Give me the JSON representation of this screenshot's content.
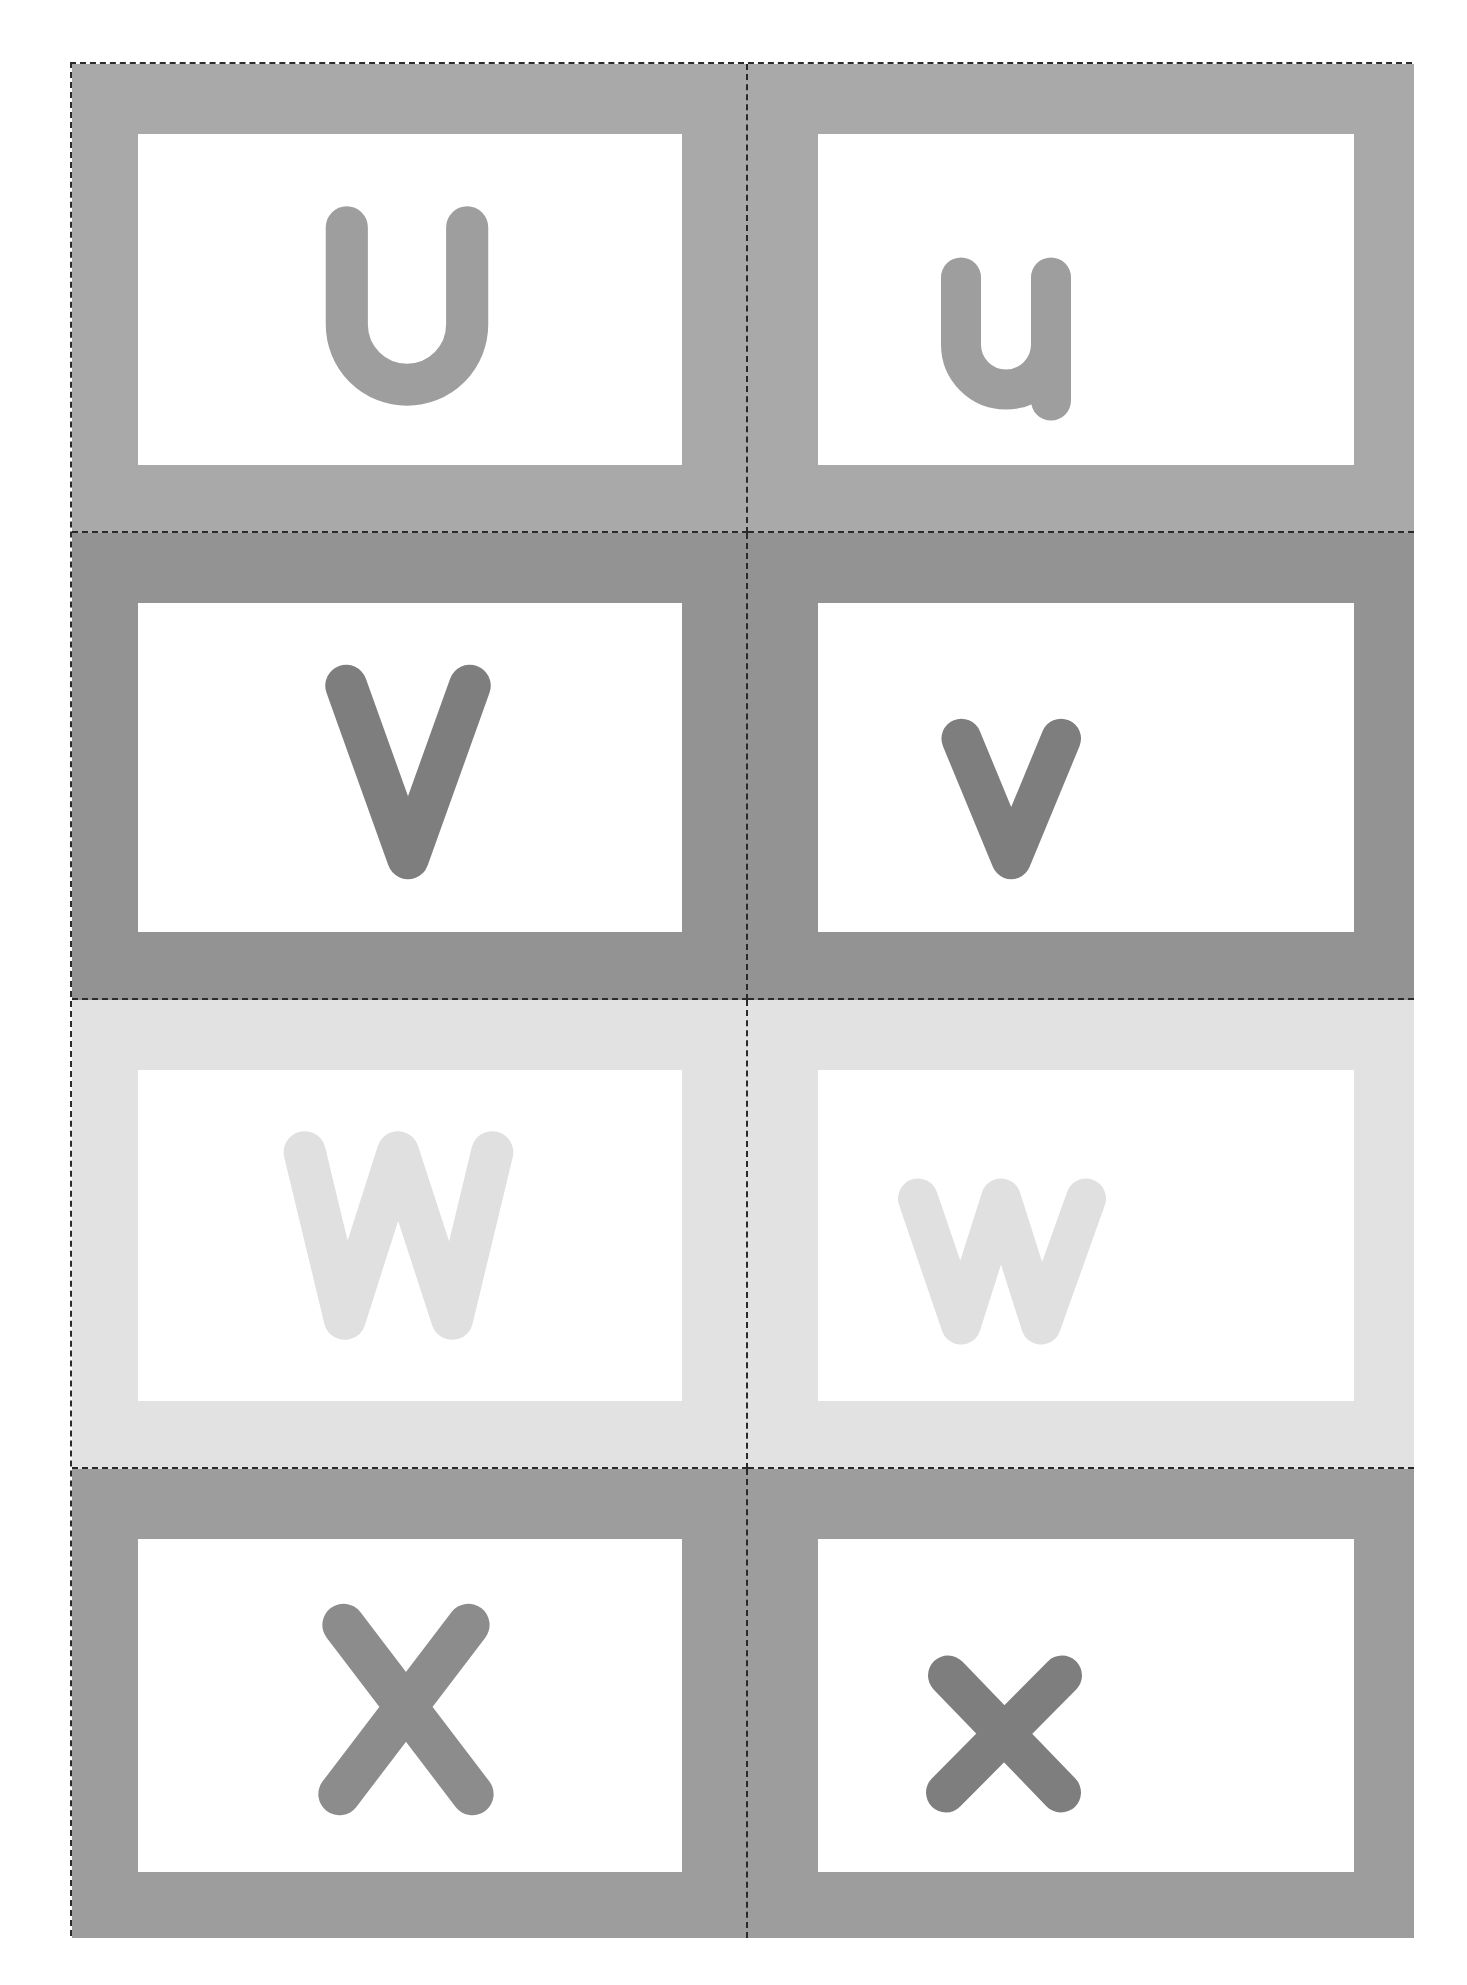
{
  "sheet": {
    "title": "Alphabet flashcards U–X",
    "border_style": "dashed cut lines",
    "cards": [
      {
        "letter": "U",
        "case": "upper",
        "bg": "#a9a9a9",
        "fg": "#9e9e9e"
      },
      {
        "letter": "u",
        "case": "lower",
        "bg": "#a9a9a9",
        "fg": "#9e9e9e"
      },
      {
        "letter": "V",
        "case": "upper",
        "bg": "#939393",
        "fg": "#7e7e7e"
      },
      {
        "letter": "v",
        "case": "lower",
        "bg": "#939393",
        "fg": "#7e7e7e"
      },
      {
        "letter": "W",
        "case": "upper",
        "bg": "#e2e2e2",
        "fg": "#e0e0e0"
      },
      {
        "letter": "w",
        "case": "lower",
        "bg": "#e2e2e2",
        "fg": "#e0e0e0"
      },
      {
        "letter": "X",
        "case": "upper",
        "bg": "#9d9d9d",
        "fg": "#8c8c8c"
      },
      {
        "letter": "x",
        "case": "lower",
        "bg": "#9d9d9d",
        "fg": "#7e7e7e"
      }
    ]
  }
}
